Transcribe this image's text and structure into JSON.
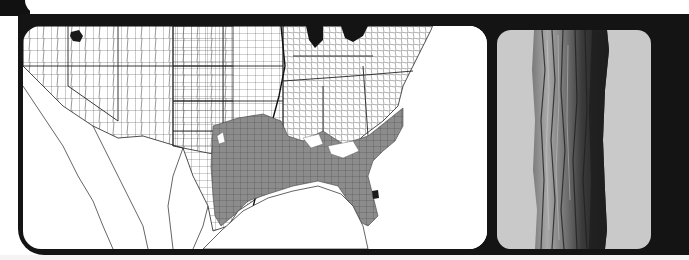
{
  "figure": {
    "panels": [
      {
        "id": "range-map",
        "type": "county-level distribution map",
        "region": "United States (western, central and eastern) with northern Mexico",
        "shaded_region": "Southeastern United States (coastal plain and lower Mississippi valley)",
        "isolated_occurrences": [
          "northern Utah",
          "southern Florida"
        ]
      },
      {
        "id": "bark-photo",
        "type": "photograph",
        "subject": "tree trunk bark"
      }
    ]
  },
  "colors": {
    "frame": "#141414",
    "map_background": "#ffffff",
    "county_lines": "#2a2a2a",
    "range_fill": "#8a8a8a",
    "disjunct_fill": "#1a1a1a",
    "photo_background": "#c9c9c9",
    "bark_light": "#9a9a9a",
    "bark_dark": "#2b2b2b"
  }
}
